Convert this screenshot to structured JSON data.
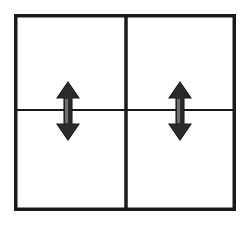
{
  "figure": {
    "title": "Rectangular frame divided into four panels with two vertical double-headed arrows",
    "background_color": "#ffffff",
    "stroke_color": "#1a1a1a",
    "arrow_fill_color": "#2b2b2b",
    "canvas": {
      "width": 250,
      "height": 225
    }
  },
  "chart_data": {
    "type": "diagram",
    "title": "",
    "elements": [
      {
        "name": "outer-frame",
        "kind": "rectangle",
        "x": 14,
        "y": 14,
        "width": 222,
        "height": 197,
        "stroke_width": 3.5,
        "fill": "none"
      },
      {
        "name": "vertical-divider",
        "kind": "line",
        "x1": 126,
        "y1": 14,
        "x2": 126,
        "y2": 211,
        "stroke_width": 3.5
      },
      {
        "name": "horizontal-divider",
        "kind": "line",
        "x1": 14,
        "y1": 110,
        "x2": 236,
        "y2": 110,
        "stroke_width": 2
      },
      {
        "name": "left-double-arrow",
        "kind": "double-headed-arrow",
        "orientation": "vertical",
        "center_x": 68,
        "top_y": 82,
        "bottom_y": 140,
        "head_width": 22,
        "head_height": 16,
        "shaft_width": 8
      },
      {
        "name": "right-double-arrow",
        "kind": "double-headed-arrow",
        "orientation": "vertical",
        "center_x": 180,
        "top_y": 82,
        "bottom_y": 140,
        "head_width": 22,
        "head_height": 16,
        "shaft_width": 8
      }
    ],
    "panels": [
      {
        "name": "top-left-panel",
        "row": 1,
        "column": 1
      },
      {
        "name": "top-right-panel",
        "row": 1,
        "column": 2
      },
      {
        "name": "bottom-left-panel",
        "row": 2,
        "column": 1
      },
      {
        "name": "bottom-right-panel",
        "row": 2,
        "column": 2
      }
    ],
    "legend": [],
    "annotations": [],
    "xlabel": "",
    "ylabel": ""
  }
}
